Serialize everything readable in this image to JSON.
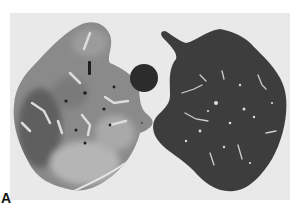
{
  "figure": {
    "panel_label": "A",
    "colors": {
      "background": "#e9e9e9",
      "left_lung_base": "#8a8a8a",
      "left_lung_dark": "#5e5e5e",
      "left_lung_light": "#b8b8b8",
      "right_lung": "#3e3e3e",
      "central_circle": "#2c2c2c",
      "vessels": "#d8d8d8"
    }
  }
}
